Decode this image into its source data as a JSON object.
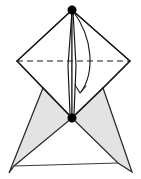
{
  "figure": {
    "canvas": {
      "width": 141,
      "height": 179,
      "background": "#ffffff"
    },
    "colors": {
      "shaded_face": "#e3e3e3",
      "unshaded_face": "#ffffff",
      "edge": "#1a1a1a",
      "thin_edge": "#3a3a3a",
      "vertex": "#000000"
    },
    "vertices": {
      "apex_top": {
        "label": "apex-top",
        "x": 72,
        "y": 10,
        "marked": true,
        "radius": 4.2
      },
      "apex_center": {
        "label": "apex-center",
        "x": 72,
        "y": 118,
        "marked": true,
        "radius": 4.2
      },
      "equator_left": {
        "label": "equator-left",
        "x": 17,
        "y": 61,
        "marked": false
      },
      "equator_right": {
        "label": "equator-right",
        "x": 130,
        "y": 61,
        "marked": false
      },
      "wing_left_top": {
        "label": "wing-left-top",
        "x": 43,
        "y": 88,
        "marked": false
      },
      "wing_right_top": {
        "label": "wing-right-top",
        "x": 103,
        "y": 88,
        "marked": false
      },
      "wing_left_outer": {
        "label": "wing-left-outer",
        "x": 9,
        "y": 173,
        "marked": false
      },
      "wing_left_inner": {
        "label": "wing-left-inner",
        "x": 14,
        "y": 166,
        "marked": false
      },
      "wing_right_inner": {
        "label": "wing-right-inner",
        "x": 118,
        "y": 163,
        "marked": false
      },
      "wing_right_outer": {
        "label": "wing-right-outer",
        "x": 132,
        "y": 172,
        "marked": false
      }
    },
    "faces": [
      {
        "name": "upper-left-face",
        "shaded": false,
        "points": "72,10 17,61 43,88 72,118"
      },
      {
        "name": "upper-right-face",
        "shaded": false,
        "points": "72,10 130,61 103,88 72,118"
      },
      {
        "name": "lower-left-wing",
        "shaded": true,
        "points": "43,88 72,118 14,166 9,173"
      },
      {
        "name": "lower-right-wing",
        "shaded": true,
        "points": "103,88 72,118 118,163 132,172"
      }
    ],
    "edges": [
      {
        "name": "edge-apex-to-equator-left",
        "style": "solid",
        "path": "M 72,10 L 17,61"
      },
      {
        "name": "edge-apex-to-equator-right",
        "style": "solid",
        "path": "M 72,10 L 130,61"
      },
      {
        "name": "edge-equator-left-to-wing-left",
        "style": "solid",
        "path": "M 17,61 L 43,88"
      },
      {
        "name": "edge-equator-right-to-wing-right",
        "style": "solid",
        "path": "M 130,61 L 103,88"
      },
      {
        "name": "edge-wing-left-to-center",
        "style": "solid",
        "path": "M 43,88 L 72,118"
      },
      {
        "name": "edge-wing-right-to-center",
        "style": "solid",
        "path": "M 103,88 L 72,118"
      },
      {
        "name": "edge-equator-dashed",
        "style": "dashed",
        "path": "M 17,61 L 130,61"
      },
      {
        "name": "edge-baseline",
        "style": "thin",
        "path": "M 14,166 L 118,163"
      }
    ],
    "axis": {
      "name": "rotation-axis-spindle",
      "left_path": "M 72,11 L 68,66 L 70,114",
      "right_path": "M 73,11 L 76,66 L 74,114"
    },
    "arc": {
      "name": "rotation-arc",
      "path": "M 73,11 C 93,38 95,72 81,92",
      "arrow_head": "M 75,85 L 80,93 L 86,86"
    }
  }
}
